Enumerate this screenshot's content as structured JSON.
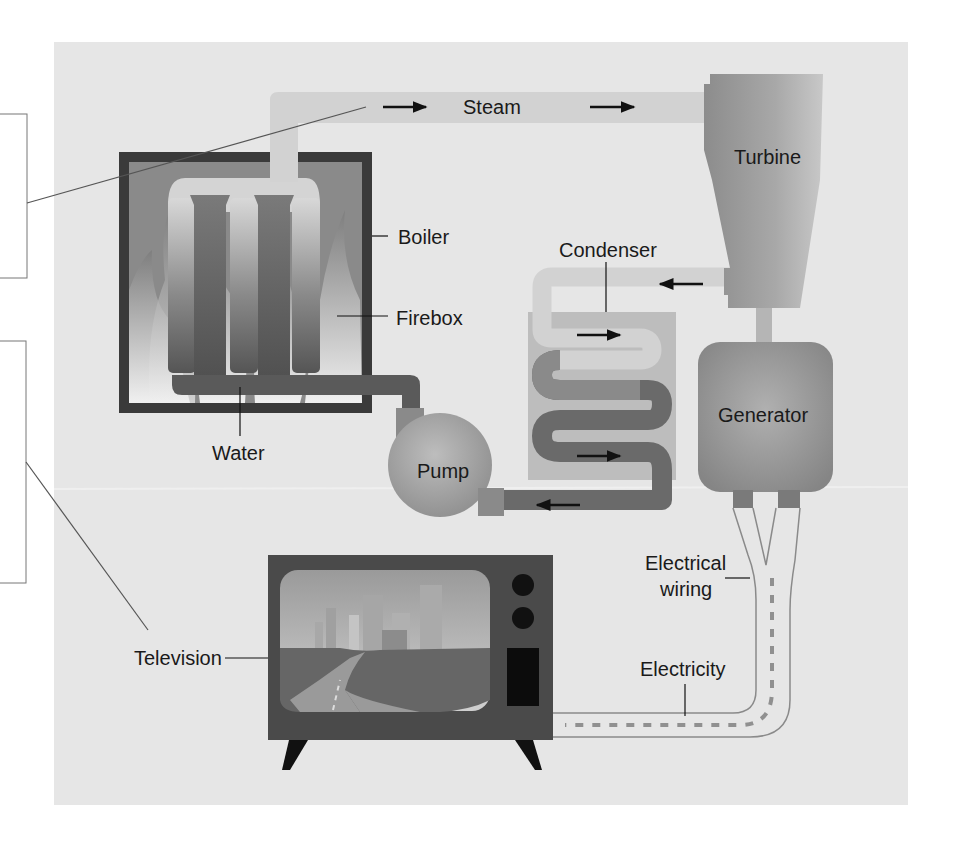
{
  "diagram": {
    "type": "power-plant-to-television energy flow",
    "colors": {
      "page": "#ffffff",
      "panel": "#e6e6e6",
      "steam": "#d2d2d2",
      "water_dark": "#5c5c5c",
      "metal": "#9a9a9a",
      "boiler_frame": "#3a3a3a",
      "tv_body": "#4a4a4a",
      "ink": "#1a1a1a"
    },
    "labels": {
      "steam": "Steam",
      "turbine": "Turbine",
      "boiler": "Boiler",
      "firebox": "Firebox",
      "condenser": "Condenser",
      "generator": "Generator",
      "water": "Water",
      "pump": "Pump",
      "electrical_wiring_line1": "Electrical",
      "electrical_wiring_line2": "wiring",
      "television": "Television",
      "electricity": "Electricity"
    },
    "answer_boxes": [
      {
        "id": "box-1",
        "text": ""
      },
      {
        "id": "box-2",
        "text": ""
      }
    ]
  }
}
